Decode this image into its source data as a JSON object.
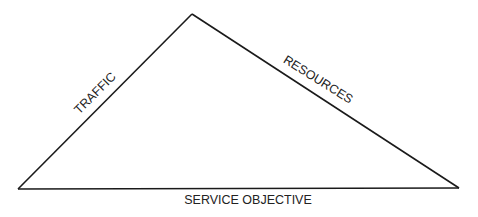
{
  "diagram": {
    "type": "triangle",
    "edges": {
      "left": "TRAFFIC",
      "right": "RESOURCES",
      "bottom": "SERVICE OBJECTIVE"
    },
    "colors": {
      "line": "#1a1a1a",
      "text": "#222222",
      "background": "#ffffff"
    }
  }
}
